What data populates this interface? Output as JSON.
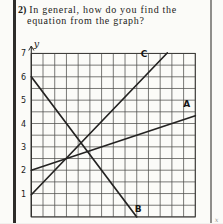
{
  "question": {
    "number": "2)",
    "line1": "In general, how do you find the",
    "line2": "equation from the graph?"
  },
  "graph": {
    "y_axis_label": "y",
    "x_axis_label": "x",
    "y_ticks": [
      "7",
      "6",
      "5",
      "4",
      "3",
      "2",
      "1"
    ]
  },
  "chart_data": {
    "type": "line",
    "title": "",
    "xlabel": "x",
    "ylabel": "y",
    "x_range": [
      0,
      7
    ],
    "y_range": [
      0,
      7
    ],
    "grid_step": 0.5,
    "grid_on": true,
    "y_tick_values": [
      7,
      6,
      5,
      4,
      3,
      2,
      1
    ],
    "lines": [
      {
        "label": "C",
        "equation": "y = x + 1",
        "points": [
          [
            0,
            0.95
          ],
          [
            5.8,
            7.02
          ]
        ],
        "label_pos": [
          4.81,
          6.85
        ]
      },
      {
        "label": "A",
        "equation": "y = x/3 + 2",
        "points": [
          [
            0,
            2
          ],
          [
            7,
            4.33
          ]
        ],
        "label_pos": [
          6.63,
          4.72
        ]
      },
      {
        "label": "B",
        "equation": "y = -4x/3 + 6",
        "points": [
          [
            0,
            6
          ],
          [
            4.5,
            0
          ]
        ],
        "label_pos": [
          4.56,
          0.22
        ]
      }
    ]
  }
}
